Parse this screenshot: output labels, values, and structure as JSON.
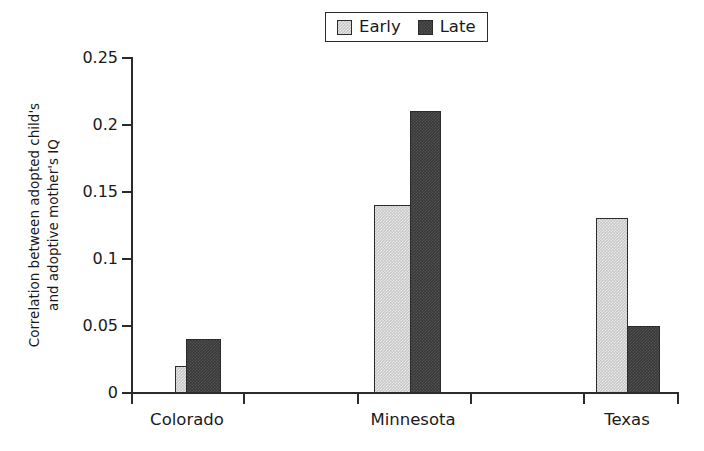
{
  "chart_data": {
    "type": "bar",
    "title": "",
    "xlabel": "",
    "ylabel_line1": "Correlation between adopted child's",
    "ylabel_line2": "and adoptive mother's IQ",
    "categories": [
      "Colorado",
      "Minnesota",
      "Texas"
    ],
    "series": [
      {
        "name": "Early",
        "color": "#c8c8c8",
        "values": [
          0.02,
          0.14,
          0.13
        ]
      },
      {
        "name": "Late",
        "color": "#3a3a3a",
        "values": [
          0.04,
          0.21,
          0.05
        ]
      }
    ],
    "ylim": [
      0,
      0.25
    ],
    "yticks": [
      0,
      0.05,
      0.1,
      0.15,
      0.2,
      0.25
    ],
    "ytick_labels": [
      "0",
      "0.05",
      "0.1",
      "0.15",
      "0.2",
      "0.25"
    ],
    "grid": false,
    "legend_position": "top-center",
    "axis_color": "#2b2b2b",
    "background": "#ffffff"
  },
  "legend": {
    "entries": [
      {
        "label": "Early"
      },
      {
        "label": "Late"
      }
    ]
  }
}
